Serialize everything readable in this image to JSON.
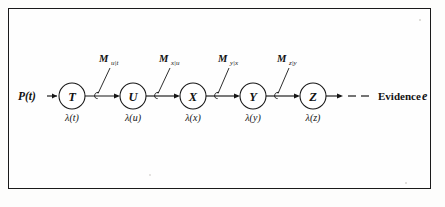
{
  "figure": {
    "type": "bayesian-network-chain-diagram",
    "border_color": "#1a1a1a",
    "ink_color": "#161616",
    "background": "#fefefe",
    "prior_label": "P(t)",
    "evidence_label": "Evidence",
    "evidence_symbol": "e"
  },
  "chain_data": {
    "type": "diagram",
    "nodes": [
      {
        "id": "T",
        "label": "T",
        "cx": 72,
        "cy": 96,
        "r": 13,
        "lambda": "λ(t)"
      },
      {
        "id": "U",
        "label": "U",
        "cx": 133,
        "cy": 96,
        "r": 13,
        "lambda": "λ(u)"
      },
      {
        "id": "X",
        "label": "X",
        "cx": 193,
        "cy": 96,
        "r": 13,
        "lambda": "λ(x)"
      },
      {
        "id": "Y",
        "label": "Y",
        "cx": 253,
        "cy": 96,
        "r": 13,
        "lambda": "λ(y)"
      },
      {
        "id": "Z",
        "label": "Z",
        "cx": 313,
        "cy": 96,
        "r": 13,
        "lambda": "λ(z)"
      }
    ],
    "edges": [
      {
        "from": "T",
        "to": "U",
        "message_base": "M",
        "message_sub": "u|t",
        "label_x": 97,
        "label_y": 62
      },
      {
        "from": "U",
        "to": "X",
        "message_base": "M",
        "message_sub": "x|u",
        "label_x": 157,
        "label_y": 62
      },
      {
        "from": "X",
        "to": "Y",
        "message_base": "M",
        "message_sub": "y|x",
        "label_x": 216,
        "label_y": 62
      },
      {
        "from": "Y",
        "to": "Z",
        "message_base": "M",
        "message_sub": "z|y",
        "label_x": 275,
        "label_y": 62
      }
    ]
  },
  "nodes": {
    "t": {
      "label": "T",
      "lambda": "λ(t)"
    },
    "u": {
      "label": "U",
      "lambda": "λ(u)"
    },
    "x": {
      "label": "X",
      "lambda": "λ(x)"
    },
    "y": {
      "label": "Y",
      "lambda": "λ(y)"
    },
    "z": {
      "label": "Z",
      "lambda": "λ(z)"
    }
  },
  "messages": {
    "m1": {
      "base": "M",
      "sub": "u|t"
    },
    "m2": {
      "base": "M",
      "sub": "x|u"
    },
    "m3": {
      "base": "M",
      "sub": "y|x"
    },
    "m4": {
      "base": "M",
      "sub": "z|y"
    }
  }
}
